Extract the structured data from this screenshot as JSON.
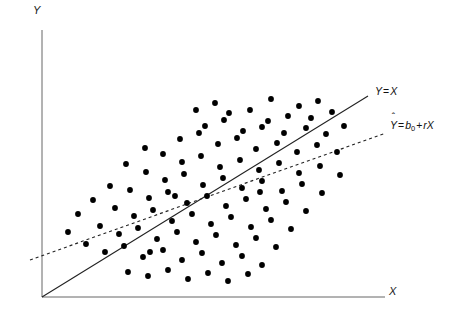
{
  "figure": {
    "type": "scatter-with-lines",
    "background_color": "#ffffff",
    "axis_color": "#666666",
    "point_color": "#000000",
    "line_color": "#222222"
  },
  "axes": {
    "y_label": "Y",
    "x_label": "X",
    "origin": {
      "x": 42,
      "y": 297
    },
    "y_axis_top": 30,
    "x_axis_right": 385,
    "ticks": [],
    "grid": false
  },
  "labels": {
    "identity_line": {
      "text": "Y = X",
      "y_symbol": "Y",
      "equals": "=",
      "x_symbol": "X"
    },
    "regression_line": {
      "text": "Ŷ = b0 + rX",
      "y_hat_symbol": "Y",
      "hat": "ˆ",
      "equals": "=",
      "intercept": "b",
      "intercept_subscript": "0",
      "plus": "+",
      "slope": "r",
      "x_symbol": "X"
    }
  },
  "chart_data": {
    "type": "scatter",
    "title": "",
    "xlabel": "X",
    "ylabel": "Y",
    "grid": false,
    "legend": "inline-annotations",
    "xlim": [
      0,
      452
    ],
    "ylim": [
      0,
      314
    ],
    "lines": [
      {
        "name": "identity-line",
        "label": "Y = X",
        "style": "solid",
        "stroke_width": 1.1,
        "color": "#222222",
        "x1": 42,
        "y1": 297,
        "x2": 368,
        "y2": 96
      },
      {
        "name": "regression-line",
        "label": "Ŷ = b0 + rX",
        "style": "dashed",
        "dash_pattern": "3,3",
        "stroke_width": 1.1,
        "color": "#222222",
        "x1": 30,
        "y1": 260,
        "x2": 386,
        "y2": 133
      }
    ],
    "intersection": {
      "x": 310,
      "y": 165
    },
    "point_radius": 2.9,
    "points": [
      [
        271,
        99
      ],
      [
        299,
        106
      ],
      [
        318,
        101
      ],
      [
        229,
        113
      ],
      [
        250,
        110
      ],
      [
        268,
        121
      ],
      [
        288,
        116
      ],
      [
        311,
        118
      ],
      [
        332,
        112
      ],
      [
        205,
        126
      ],
      [
        224,
        120
      ],
      [
        243,
        131
      ],
      [
        262,
        127
      ],
      [
        284,
        133
      ],
      [
        306,
        128
      ],
      [
        326,
        134
      ],
      [
        344,
        126
      ],
      [
        180,
        139
      ],
      [
        199,
        133
      ],
      [
        218,
        144
      ],
      [
        237,
        138
      ],
      [
        256,
        149
      ],
      [
        277,
        143
      ],
      [
        297,
        152
      ],
      [
        317,
        145
      ],
      [
        337,
        152
      ],
      [
        163,
        154
      ],
      [
        182,
        162
      ],
      [
        201,
        156
      ],
      [
        220,
        167
      ],
      [
        240,
        160
      ],
      [
        259,
        170
      ],
      [
        279,
        163
      ],
      [
        299,
        173
      ],
      [
        320,
        166
      ],
      [
        340,
        175
      ],
      [
        146,
        172
      ],
      [
        165,
        180
      ],
      [
        184,
        174
      ],
      [
        203,
        185
      ],
      [
        223,
        178
      ],
      [
        242,
        188
      ],
      [
        262,
        181
      ],
      [
        282,
        191
      ],
      [
        302,
        184
      ],
      [
        322,
        193
      ],
      [
        130,
        190
      ],
      [
        149,
        198
      ],
      [
        168,
        192
      ],
      [
        187,
        203
      ],
      [
        207,
        196
      ],
      [
        226,
        206
      ],
      [
        246,
        199
      ],
      [
        266,
        209
      ],
      [
        286,
        202
      ],
      [
        306,
        211
      ],
      [
        115,
        208
      ],
      [
        134,
        216
      ],
      [
        153,
        210
      ],
      [
        172,
        221
      ],
      [
        192,
        214
      ],
      [
        211,
        224
      ],
      [
        231,
        217
      ],
      [
        251,
        227
      ],
      [
        271,
        220
      ],
      [
        291,
        229
      ],
      [
        100,
        226
      ],
      [
        119,
        234
      ],
      [
        138,
        228
      ],
      [
        157,
        239
      ],
      [
        177,
        232
      ],
      [
        196,
        242
      ],
      [
        216,
        235
      ],
      [
        236,
        245
      ],
      [
        256,
        238
      ],
      [
        276,
        247
      ],
      [
        86,
        244
      ],
      [
        105,
        252
      ],
      [
        124,
        246
      ],
      [
        143,
        257
      ],
      [
        163,
        250
      ],
      [
        182,
        260
      ],
      [
        202,
        253
      ],
      [
        222,
        263
      ],
      [
        242,
        256
      ],
      [
        262,
        265
      ],
      [
        68,
        232
      ],
      [
        78,
        214
      ],
      [
        93,
        200
      ],
      [
        110,
        186
      ],
      [
        126,
        164
      ],
      [
        145,
        148
      ],
      [
        196,
        110
      ],
      [
        215,
        103
      ],
      [
        128,
        272
      ],
      [
        148,
        276
      ],
      [
        168,
        270
      ],
      [
        188,
        279
      ],
      [
        208,
        273
      ],
      [
        228,
        281
      ],
      [
        248,
        274
      ],
      [
        150,
        252
      ],
      [
        175,
        196
      ],
      [
        260,
        192
      ]
    ]
  }
}
